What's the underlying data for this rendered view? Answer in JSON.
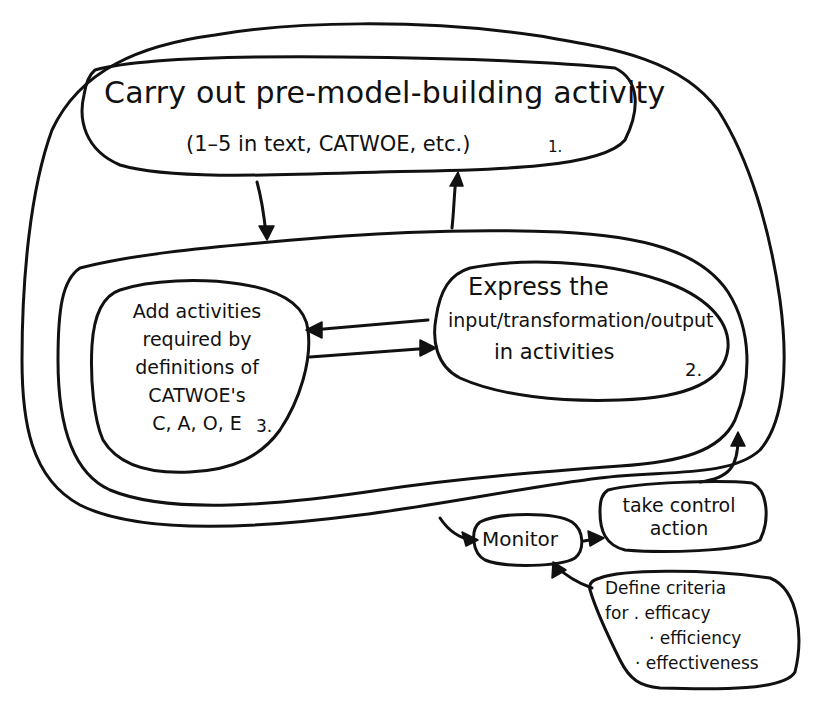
{
  "diagram": {
    "type": "hand-drawn soft systems model (process/control loop)",
    "stroke_color": "#111111",
    "background_color": "#ffffff"
  },
  "nodes": {
    "pre_model": {
      "title": "Carry out pre-model-building activity",
      "subtitle": "(1–5 in text, CATWOE, etc.)",
      "number": "1."
    },
    "express": {
      "lines": [
        "Express the",
        "input/transformation/output",
        "in activities"
      ],
      "number": "2."
    },
    "add_activities": {
      "lines": [
        "Add activities",
        "required by",
        "definitions of",
        "CATWOE's",
        "C, A, O, E"
      ],
      "number": "3."
    },
    "monitor": {
      "label": "Monitor"
    },
    "take_control": {
      "lines": [
        "take control",
        "action"
      ]
    },
    "define_criteria": {
      "lines": [
        "Define criteria",
        "for . efficacy",
        "· efficiency",
        "· effectiveness"
      ]
    }
  },
  "edges": [
    {
      "from": "pre_model",
      "to": "operational_subsystem",
      "direction": "down"
    },
    {
      "from": "operational_subsystem",
      "to": "pre_model",
      "direction": "up"
    },
    {
      "from": "express",
      "to": "add_activities",
      "direction": "left"
    },
    {
      "from": "add_activities",
      "to": "express",
      "direction": "right"
    },
    {
      "from": "outer_system",
      "to": "monitor"
    },
    {
      "from": "monitor",
      "to": "take_control"
    },
    {
      "from": "take_control",
      "to": "outer_system"
    },
    {
      "from": "define_criteria",
      "to": "monitor"
    }
  ]
}
